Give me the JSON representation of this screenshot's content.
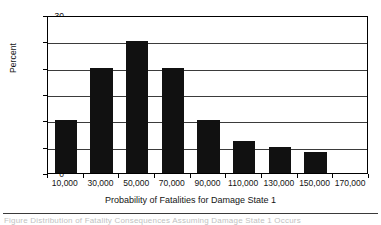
{
  "chart_data": {
    "type": "bar",
    "title": "",
    "xlabel": "Probability of Fatalities for Damage State 1",
    "ylabel": "Percent",
    "categories": [
      "10,000",
      "30,000",
      "50,000",
      "70,000",
      "90,000",
      "110,000",
      "130,000",
      "150,000",
      "170,000"
    ],
    "values": [
      10,
      20,
      25,
      20,
      10,
      6,
      5,
      4,
      0
    ],
    "ylim": [
      0,
      30
    ],
    "ytick_labels": [
      "0",
      "5",
      "10",
      "15",
      "20",
      "25",
      "30"
    ],
    "ytick_values": [
      0,
      5,
      10,
      15,
      20,
      25,
      30
    ],
    "grid": "horizontal",
    "legend": "none",
    "bar_color": "#111111",
    "plot_background": "#ffffff",
    "axis_color": "#000000",
    "gridline_color": "#3b3b3b"
  },
  "footer": {
    "caption_clipped": "Figure  Distribution of Fatality Consequences Assuming Damage State 1 Occurs"
  }
}
